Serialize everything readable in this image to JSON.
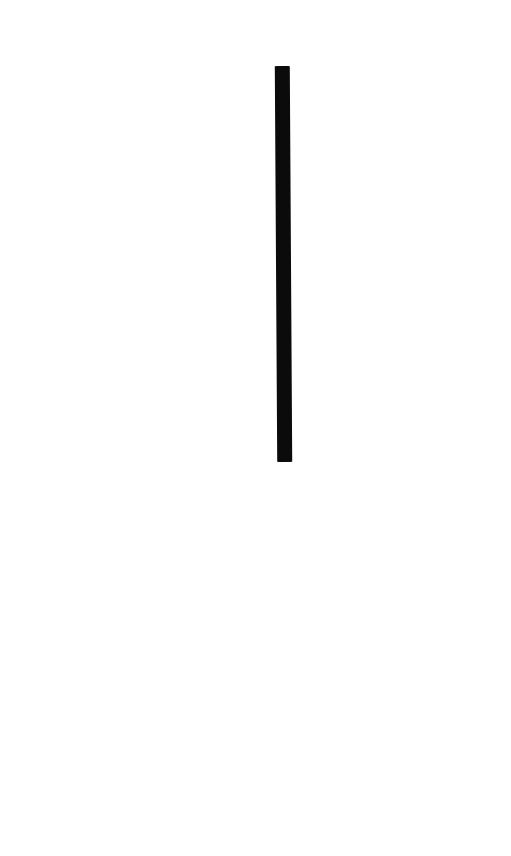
{
  "page": {
    "background_color": "#ffffff"
  },
  "bar": {
    "name": "black-vertical-bar",
    "color": "#0b0b0b",
    "x": 276,
    "y": 66,
    "width": 15,
    "height": 396,
    "tilt_deg": -0.35
  }
}
